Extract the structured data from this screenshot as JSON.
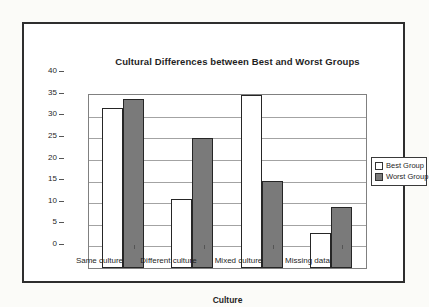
{
  "figure": {
    "background": "#ffffff",
    "border_color": "#2e2e2e"
  },
  "chart_data": {
    "type": "bar",
    "title": "Cultural Differences between Best and Worst Groups",
    "xlabel": "Culture",
    "ylabel": "",
    "categories": [
      "Same culture",
      "Different culture",
      "Mixed culture",
      "Missing data"
    ],
    "series": [
      {
        "name": "Best Group",
        "color": "#ffffff",
        "values": [
          37,
          16,
          40,
          8
        ]
      },
      {
        "name": "Worst Group",
        "color": "#7a7a7a",
        "values": [
          39,
          30,
          20,
          14
        ]
      }
    ],
    "ylim": [
      0,
      40
    ],
    "yticks": [
      0,
      5,
      10,
      15,
      20,
      25,
      30,
      35,
      40
    ],
    "grid": true,
    "legend_position": "right",
    "gridline_color": "#a3a3a3",
    "plot_border_color": "#808080",
    "axis_tick_color": "#555555",
    "bar_border_color": "#262626"
  }
}
